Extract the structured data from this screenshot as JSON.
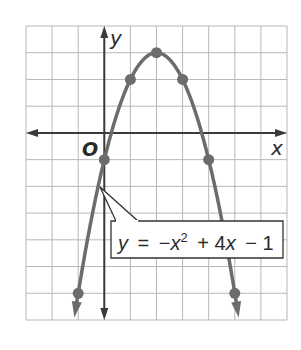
{
  "chart_data": {
    "type": "line",
    "title": "",
    "equation": "y = −x² + 4x − 1",
    "equation_parts": {
      "lhs": "y",
      "eq": "=",
      "neg": "−",
      "x": "x",
      "exp": "2",
      "rest": "+ 4",
      "x2": "x",
      "tail": "− 1"
    },
    "xlabel": "x",
    "ylabel": "y",
    "origin_label": "O",
    "xlim": [
      -3,
      7
    ],
    "ylim": [
      -7,
      4
    ],
    "grid": true,
    "grid_step": 1,
    "series": [
      {
        "name": "y = -x^2 + 4x - 1",
        "function": "-x^2 + 4x - 1",
        "plotted_points": [
          {
            "x": -1,
            "y": -6
          },
          {
            "x": 0,
            "y": -1
          },
          {
            "x": 1,
            "y": 2
          },
          {
            "x": 2,
            "y": 3
          },
          {
            "x": 3,
            "y": 2
          },
          {
            "x": 4,
            "y": -1
          },
          {
            "x": 5,
            "y": -6
          }
        ],
        "vertex": {
          "x": 2,
          "y": 3
        },
        "arrows_both_ends": true
      }
    ],
    "callout": {
      "target": {
        "x": 0,
        "y": -2
      },
      "text": "y = −x² + 4x − 1"
    }
  },
  "colors": {
    "curve": "#6c6c6c",
    "grid": "#b8b8b8",
    "axes": "#3a3a3a",
    "text": "#2a2a2a",
    "callout_border": "#333333"
  }
}
